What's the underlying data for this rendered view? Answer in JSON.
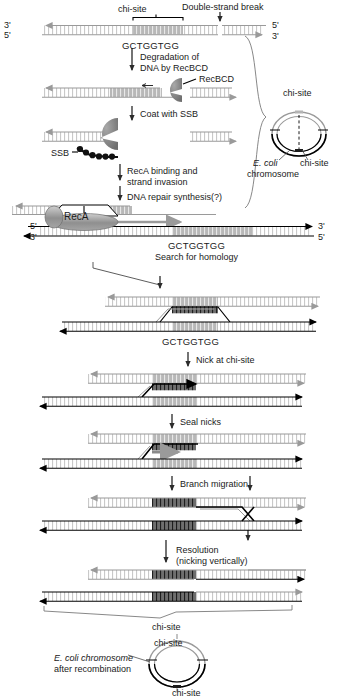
{
  "figure": {
    "title_hidden": "",
    "chi_sequence": "GCTGGTGG",
    "labels": {
      "chi_site": "chi-site",
      "double_strand_break": "Double-strand break",
      "recbcd": "RecBCD",
      "ssb": "SSB",
      "reca": "RecA",
      "ecoli_chromosome_1": "E. coli",
      "ecoli_chromosome_2": "chromosome",
      "ecoli_after_1": "E. coli chromosome",
      "ecoli_after_2": "after recombination",
      "five_prime": "5'",
      "three_prime": "3'"
    },
    "steps": [
      {
        "id": "degradation",
        "line1": "Degradation of",
        "line2": "DNA by RecBCD"
      },
      {
        "id": "coat-ssb",
        "line1": "Coat with SSB",
        "line2": ""
      },
      {
        "id": "reca-binding",
        "line1": "RecA binding and",
        "line2": "strand invasion"
      },
      {
        "id": "repair-synthesis",
        "line1": "DNA repair synthesis(?)",
        "line2": ""
      },
      {
        "id": "search-homology",
        "line1": "Search for homology",
        "line2": ""
      },
      {
        "id": "nick-chi",
        "line1": "Nick at chi-site",
        "line2": ""
      },
      {
        "id": "seal-nicks",
        "line1": "Seal nicks",
        "line2": ""
      },
      {
        "id": "branch-migration",
        "line1": "Branch migration",
        "line2": ""
      },
      {
        "id": "resolution",
        "line1": "Resolution",
        "line2": "(nicking vertically)"
      }
    ],
    "colors": {
      "strand_black": "#000000",
      "strand_gray": "#9a9a9a",
      "chi_block_light": "#b8b8b8",
      "chi_block_dark": "#6e6e6e",
      "protein_gray": "#808080",
      "background": "#ffffff"
    }
  }
}
